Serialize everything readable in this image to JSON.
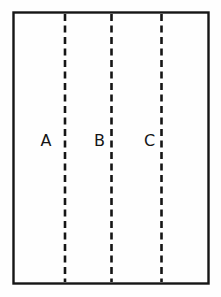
{
  "figure": {
    "name": "partitioned-rectangle-diagram",
    "background_color": "#fefefe",
    "stroke_color": "#151515",
    "width": 221,
    "height": 297
  },
  "frame": {
    "name": "outer-rectangle",
    "x": 13.5,
    "y": 12.5,
    "width": 195,
    "height": 271,
    "stroke_width": 2.4,
    "fill": "none"
  },
  "dashed_lines": [
    {
      "id": "dashed-line-a",
      "x": 65,
      "y_top": 14,
      "y_bottom": 282,
      "stroke_width": 2.6,
      "dash": "7 4.5"
    },
    {
      "id": "dashed-line-b",
      "x": 111.5,
      "y_top": 14,
      "y_bottom": 282,
      "stroke_width": 2.6,
      "dash": "7 4.5"
    },
    {
      "id": "dashed-line-c",
      "x": 161.5,
      "y_top": 14,
      "y_bottom": 282,
      "stroke_width": 2.6,
      "dash": "7 4.5"
    }
  ],
  "labels": [
    {
      "id": "label-a",
      "text": "A",
      "x": 46,
      "y": 146
    },
    {
      "id": "label-b",
      "text": "B",
      "x": 99.5,
      "y": 146
    },
    {
      "id": "label-c",
      "text": "C",
      "x": 149.5,
      "y": 146
    }
  ]
}
